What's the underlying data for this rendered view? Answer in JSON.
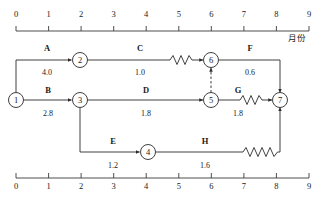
{
  "diagram": {
    "kind": "time-scaled-network-diagram",
    "axis_unit_label": "月份",
    "top_axis": {
      "ticks": [
        "0",
        "1",
        "2",
        "3",
        "4",
        "5",
        "6",
        "7",
        "8",
        "9"
      ],
      "min": 0,
      "max": 9
    },
    "bottom_axis": {
      "ticks": [
        "0",
        "1",
        "2",
        "3",
        "4",
        "5",
        "6",
        "7",
        "8",
        "9"
      ],
      "min": 0,
      "max": 9
    },
    "nodes": [
      {
        "id": "1",
        "label": "1",
        "x": 16,
        "y": 100
      },
      {
        "id": "2",
        "label": "2",
        "x": 80,
        "y": 60
      },
      {
        "id": "3",
        "label": "3",
        "x": 80,
        "y": 100
      },
      {
        "id": "4",
        "label": "4",
        "x": 148,
        "y": 152
      },
      {
        "id": "5",
        "label": "5",
        "x": 211,
        "y": 100
      },
      {
        "id": "6",
        "label": "6",
        "x": 211,
        "y": 60
      },
      {
        "id": "7",
        "label": "7",
        "x": 280,
        "y": 100
      }
    ],
    "activities": [
      {
        "key": "A",
        "name": "A",
        "duration": "4.0",
        "from": "1",
        "to": "2",
        "name_x": 47,
        "name_y": 48,
        "dur_x": 47,
        "dur_y": 72,
        "has_float": false
      },
      {
        "key": "B",
        "name": "B",
        "duration": "2.8",
        "from": "1",
        "to": "3",
        "name_x": 48,
        "name_y": 90,
        "dur_x": 48,
        "dur_y": 113,
        "has_float": false
      },
      {
        "key": "C",
        "name": "C",
        "duration": "1.0",
        "from": "2",
        "to": "6",
        "name_x": 140,
        "name_y": 48,
        "dur_x": 140,
        "dur_y": 72,
        "has_float": true
      },
      {
        "key": "D",
        "name": "D",
        "duration": "1.8",
        "from": "3",
        "to": "5",
        "name_x": 146,
        "name_y": 90,
        "dur_x": 146,
        "dur_y": 113,
        "has_float": false
      },
      {
        "key": "E",
        "name": "E",
        "duration": "1.2",
        "from": "3",
        "to": "4",
        "name_x": 113,
        "name_y": 141,
        "dur_x": 113,
        "dur_y": 165,
        "has_float": false
      },
      {
        "key": "F",
        "name": "F",
        "duration": "0.6",
        "from": "6",
        "to": "7",
        "name_x": 250,
        "name_y": 48,
        "dur_x": 250,
        "dur_y": 72,
        "has_float": false
      },
      {
        "key": "G",
        "name": "G",
        "duration": "1.8",
        "from": "5",
        "to": "7",
        "name_x": 238,
        "name_y": 90,
        "dur_x": 238,
        "dur_y": 113,
        "has_float": true
      },
      {
        "key": "H",
        "name": "H",
        "duration": "1.6",
        "from": "4",
        "to": "7",
        "name_x": 205,
        "name_y": 141,
        "dur_x": 205,
        "dur_y": 165,
        "has_float": true
      }
    ],
    "dummy_activities": [
      {
        "from": "5",
        "to": "6",
        "style": "dashed"
      }
    ],
    "colors": {
      "line": "#2a2a2a",
      "text": "#1a1a1a",
      "background": "#ffffff",
      "axis": "#3a3a3a"
    }
  }
}
